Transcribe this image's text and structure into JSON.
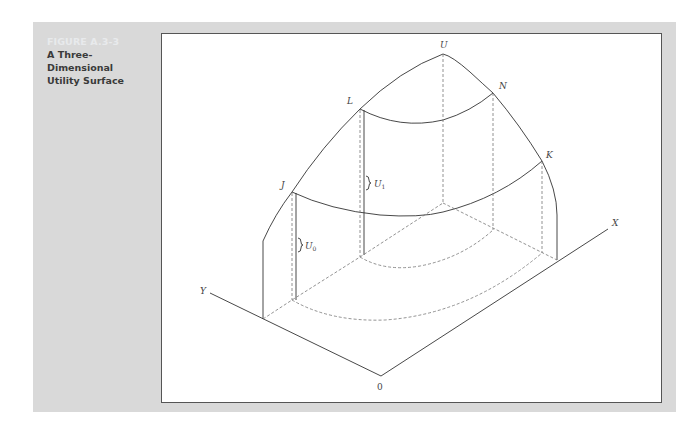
{
  "figure": {
    "number": "FIGURE A.3-3",
    "title_line1": "A Three-Dimensional",
    "title_line2": "Utility Surface"
  },
  "diagram": {
    "labels": {
      "apex": "U",
      "point_L": "L",
      "point_N": "N",
      "point_J": "J",
      "point_K": "K",
      "u1_main": "U",
      "u1_sub": "1",
      "u0_main": "U",
      "u0_sub": "0",
      "axis_x": "X",
      "axis_y": "Y",
      "origin": "0"
    }
  },
  "colors": {
    "panel_bg": "#d9d9d9",
    "figure_number": "#e8eaec",
    "title_text": "#3a3a3a",
    "line": "#333333",
    "dashed": "#777777"
  }
}
